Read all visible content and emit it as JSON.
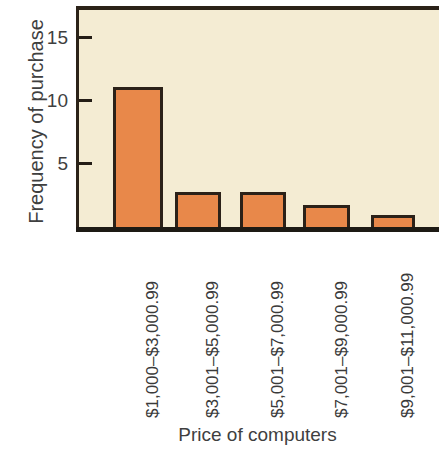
{
  "chart_data": {
    "type": "bar",
    "title": "",
    "xlabel": "Price of computers",
    "ylabel": "Frequency of purchase",
    "categories": [
      "$1,000–$3,000.99",
      "$3,001–$5,000.99",
      "$5,001–$7,000.99",
      "$7,001–$9,000.99",
      "$9,001–$11,000.99"
    ],
    "values": [
      11.4,
      3.1,
      3.1,
      2.1,
      1.3
    ],
    "ylim": [
      0,
      17.5
    ],
    "yticks": [
      5,
      10,
      15
    ],
    "ytick_labels": [
      "5",
      "10",
      "15"
    ],
    "grid": false,
    "legend": null,
    "colors": {
      "bar_fill": "#e8884a",
      "bar_edge": "#2b2118",
      "plot_background": "#f4ecd3",
      "axis": "#1d1a14",
      "text": "#3f3f3f",
      "figure_background": "#ffffff"
    }
  },
  "axes": {
    "y_title": "Frequency of purchase",
    "x_title": "Price of computers",
    "y_ticks": [
      {
        "label": "15",
        "value": 15
      },
      {
        "label": "10",
        "value": 10
      },
      {
        "label": "5",
        "value": 5
      }
    ]
  }
}
